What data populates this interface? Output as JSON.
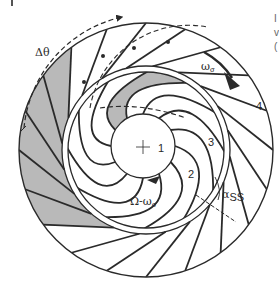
{
  "figure": {
    "type": "impeller-cross-section",
    "labels": {
      "delta_theta": "Δθ",
      "omega_sigma": "ω",
      "omega_sigma_sub": "σ",
      "omega_diff": "Ω-ω",
      "omega_diff_sub": "σ",
      "alpha": "α",
      "alpha_sub": "SS",
      "point_1": "1",
      "point_2": "2",
      "point_3": "3",
      "point_4": "4"
    },
    "outer_vane_count": 20,
    "inner_blade_count": 12,
    "colors": {
      "stroke": "#2a2a2a",
      "shade": "#b9b9b9",
      "background": "#ffffff"
    }
  },
  "edge_text": [
    "I",
    "v",
    "("
  ]
}
